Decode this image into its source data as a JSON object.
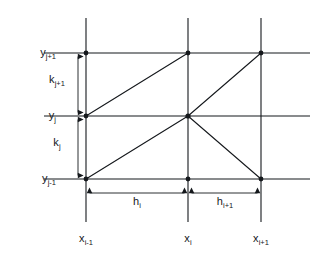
{
  "figure": {
    "kind": "finite-element-grid-diagram",
    "background_color": "#ffffff",
    "line_color": "#15181c",
    "node_color": "#15181c"
  },
  "axis_labels": {
    "y_top": {
      "base": "y",
      "sub": "j+1"
    },
    "y_mid": {
      "base": "y",
      "sub": "j"
    },
    "y_bottom": {
      "base": "y",
      "sub": "j-1"
    },
    "x_left": {
      "base": "x",
      "sub": "i-1"
    },
    "x_mid": {
      "base": "x",
      "sub": "i"
    },
    "x_right": {
      "base": "x",
      "sub": "i+1"
    }
  },
  "dimension_labels": {
    "k_upper": {
      "base": "k",
      "sub": "j+1"
    },
    "k_lower": {
      "base": "k",
      "sub": "j"
    },
    "h_left": {
      "base": "h",
      "sub": "i"
    },
    "h_right": {
      "base": "h",
      "sub": "i+1"
    }
  },
  "geometry": {
    "grid_x": {
      "x_left": 86,
      "x_mid": 188,
      "x_right": 261
    },
    "grid_y": {
      "y_top": 53,
      "y_mid": 116,
      "y_bottom": 179
    },
    "horizontal_line_extent": {
      "start": 44,
      "end": 310
    },
    "vertical_line_extent": {
      "start": 18,
      "end": 222
    },
    "dimension_rule_x": 78,
    "dimension_rule_y": 193,
    "node_radius": 2.4,
    "grid_stroke_width": 1.1,
    "diagonal_stroke_width": 1.1,
    "dimension_stroke_width": 0.9
  },
  "nodes": [
    {
      "id": "n-left-top",
      "x": 86,
      "y": 53
    },
    {
      "id": "n-mid-top",
      "x": 188,
      "y": 53
    },
    {
      "id": "n-right-top",
      "x": 261,
      "y": 53
    },
    {
      "id": "n-left-mid",
      "x": 86,
      "y": 116
    },
    {
      "id": "n-mid-mid",
      "x": 188,
      "y": 116
    },
    {
      "id": "n-left-bottom",
      "x": 86,
      "y": 179
    },
    {
      "id": "n-mid-bottom",
      "x": 188,
      "y": 179
    },
    {
      "id": "n-right-bottom",
      "x": 261,
      "y": 179
    }
  ],
  "diagonals": [
    {
      "id": "diag-upper-left",
      "x1": 86,
      "y1": 116,
      "x2": 188,
      "y2": 53
    },
    {
      "id": "diag-lower-left",
      "x1": 86,
      "y1": 179,
      "x2": 188,
      "y2": 116
    },
    {
      "id": "diag-upper-right",
      "x1": 188,
      "y1": 116,
      "x2": 261,
      "y2": 53
    },
    {
      "id": "diag-lower-right",
      "x1": 188,
      "y1": 116,
      "x2": 261,
      "y2": 179
    }
  ]
}
